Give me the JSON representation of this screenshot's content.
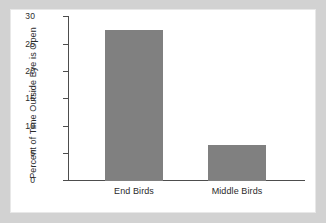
{
  "chart_data": {
    "type": "bar",
    "title": "",
    "xlabel": "",
    "ylabel": "Percent of Time Outside Eye is Open",
    "categories": [
      "End Birds",
      "Middle Birds"
    ],
    "values": [
      27.5,
      6.6
    ],
    "ylim": [
      0,
      30
    ],
    "yticks": [
      0,
      5,
      10,
      15,
      20,
      25,
      30
    ],
    "ytick_labels": [
      "0",
      "5",
      "10",
      "15",
      "20",
      "25",
      "30"
    ],
    "grid": false,
    "legend": null,
    "bar_color": "#808080",
    "axis_color": "#4d4d4d",
    "panel_background": "#ffffff",
    "figure_background": "#d2d2d2"
  }
}
